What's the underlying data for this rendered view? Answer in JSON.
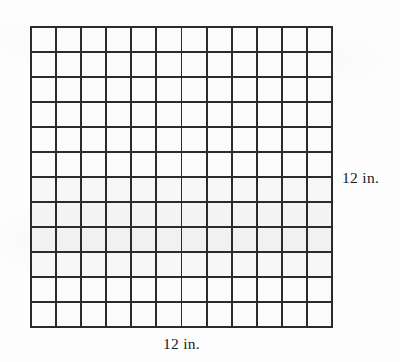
{
  "figure": {
    "kind": "grid-square-figure",
    "grid": {
      "columns": 12,
      "rows": 12,
      "total_cells": 144,
      "cell_label": "",
      "line_color": "#2b2b2b",
      "cell_fill_color": "#fbfbfb",
      "outer_border_color": "#2b2b2b"
    },
    "labels": {
      "right": "12 in.",
      "bottom": "12 in."
    },
    "background_color": "#fdfdfd"
  },
  "chart_data": {
    "type": "table",
    "title": "",
    "xlabel": "12 in.",
    "ylabel": "12 in.",
    "columns": 12,
    "rows": 12,
    "values": [
      [
        1,
        1,
        1,
        1,
        1,
        1,
        1,
        1,
        1,
        1,
        1,
        1
      ],
      [
        1,
        1,
        1,
        1,
        1,
        1,
        1,
        1,
        1,
        1,
        1,
        1
      ],
      [
        1,
        1,
        1,
        1,
        1,
        1,
        1,
        1,
        1,
        1,
        1,
        1
      ],
      [
        1,
        1,
        1,
        1,
        1,
        1,
        1,
        1,
        1,
        1,
        1,
        1
      ],
      [
        1,
        1,
        1,
        1,
        1,
        1,
        1,
        1,
        1,
        1,
        1,
        1
      ],
      [
        1,
        1,
        1,
        1,
        1,
        1,
        1,
        1,
        1,
        1,
        1,
        1
      ],
      [
        1,
        1,
        1,
        1,
        1,
        1,
        1,
        1,
        1,
        1,
        1,
        1
      ],
      [
        1,
        1,
        1,
        1,
        1,
        1,
        1,
        1,
        1,
        1,
        1,
        1
      ],
      [
        1,
        1,
        1,
        1,
        1,
        1,
        1,
        1,
        1,
        1,
        1,
        1
      ],
      [
        1,
        1,
        1,
        1,
        1,
        1,
        1,
        1,
        1,
        1,
        1,
        1
      ],
      [
        1,
        1,
        1,
        1,
        1,
        1,
        1,
        1,
        1,
        1,
        1,
        1
      ],
      [
        1,
        1,
        1,
        1,
        1,
        1,
        1,
        1,
        1,
        1,
        1,
        1
      ]
    ],
    "grid": true,
    "legend": "none"
  }
}
